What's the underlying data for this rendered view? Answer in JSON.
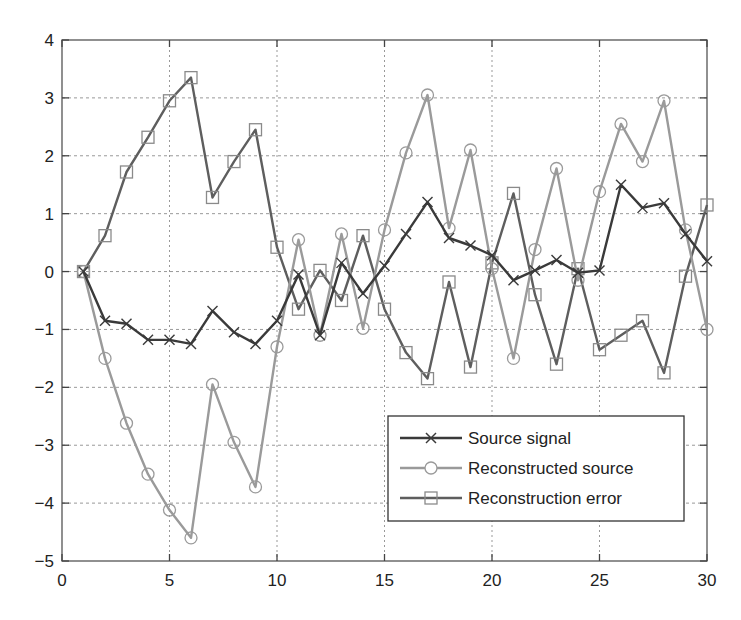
{
  "chart_data": {
    "type": "line",
    "title": "",
    "xlabel": "",
    "ylabel": "",
    "xlim": [
      0,
      30
    ],
    "ylim": [
      -5,
      4
    ],
    "xticks": [
      0,
      5,
      10,
      15,
      20,
      25,
      30
    ],
    "yticks": [
      -5,
      -4,
      -3,
      -2,
      -1,
      0,
      1,
      2,
      3,
      4
    ],
    "grid": true,
    "legend_position": "lower right",
    "x": [
      1,
      2,
      3,
      4,
      5,
      6,
      7,
      8,
      9,
      10,
      11,
      12,
      13,
      14,
      15,
      16,
      17,
      18,
      19,
      20,
      21,
      22,
      23,
      24,
      25,
      26,
      27,
      28,
      29,
      30
    ],
    "series": [
      {
        "name": "Source signal",
        "marker": "x",
        "color": "#3a3a3a",
        "values": [
          0,
          -0.85,
          -0.9,
          -1.18,
          -1.18,
          -1.25,
          -0.68,
          -1.05,
          -1.25,
          -0.85,
          -0.05,
          -1.1,
          0.15,
          -0.38,
          0.1,
          0.65,
          1.2,
          0.58,
          0.45,
          0.28,
          -0.15,
          0.02,
          0.2,
          -0.02,
          0.02,
          1.5,
          1.1,
          1.18,
          0.65,
          0.18
        ]
      },
      {
        "name": "Reconstructed source",
        "marker": "o",
        "color": "#9a9a9a",
        "values": [
          0,
          -1.5,
          -2.62,
          -3.5,
          -4.12,
          -4.6,
          -1.95,
          -2.95,
          -3.72,
          -1.3,
          0.55,
          -1.1,
          0.65,
          -0.98,
          0.72,
          2.05,
          3.05,
          0.75,
          2.1,
          0.05,
          -1.5,
          0.38,
          1.78,
          -0.15,
          1.38,
          2.55,
          1.9,
          2.95,
          0.72,
          -1.0
        ]
      },
      {
        "name": "Reconstruction error",
        "marker": "s",
        "color": "#5e5e5e",
        "values": [
          0,
          0.62,
          1.72,
          2.32,
          2.95,
          3.35,
          1.28,
          1.9,
          2.45,
          0.42,
          -0.65,
          0.02,
          -0.5,
          0.62,
          -0.65,
          -1.4,
          -1.85,
          -0.18,
          -1.65,
          0.15,
          1.35,
          -0.4,
          -1.6,
          0.05,
          -1.35,
          -1.1,
          -0.85,
          -1.75,
          -0.08,
          1.15
        ]
      }
    ]
  },
  "legend": {
    "items": [
      {
        "label": "Source signal"
      },
      {
        "label": "Reconstructed source"
      },
      {
        "label": "Reconstruction error"
      }
    ]
  }
}
